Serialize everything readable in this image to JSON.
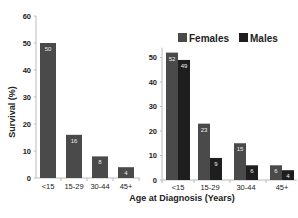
{
  "chart_data": [
    {
      "type": "bar",
      "title": "",
      "xlabel": "Age at Diagnosis (Years)",
      "ylabel": "Survival (%)",
      "categories": [
        "<15",
        "15-29",
        "30-44",
        "45+"
      ],
      "values": [
        50,
        16,
        8,
        4
      ],
      "data_labels": [
        "50",
        "16",
        "8",
        "4"
      ],
      "yticks": [
        0,
        10,
        20,
        30,
        40,
        50,
        60
      ],
      "ylim": [
        0,
        60
      ],
      "grid": false,
      "color": "#4a4a4a"
    },
    {
      "type": "bar",
      "title": "",
      "xlabel": "Age at Diagnosis (Years)",
      "ylabel": "",
      "categories": [
        "<15",
        "15-29",
        "30-44",
        "45+"
      ],
      "series": [
        {
          "name": "Females",
          "values": [
            52,
            23,
            15,
            6
          ],
          "color": "#4a4a4a"
        },
        {
          "name": "Males",
          "values": [
            49,
            9,
            6,
            4
          ],
          "color": "#1e1e1e"
        }
      ],
      "yticks": [
        0,
        10,
        20,
        30,
        40,
        50
      ],
      "ylim": [
        0,
        55
      ],
      "grid": false,
      "legend_position": "top-right"
    }
  ],
  "labels": {
    "ylabel": "Survival (%)",
    "xlabel": "Age at Diagnosis (Years)",
    "legend_females": "Females",
    "legend_males": "Males"
  }
}
